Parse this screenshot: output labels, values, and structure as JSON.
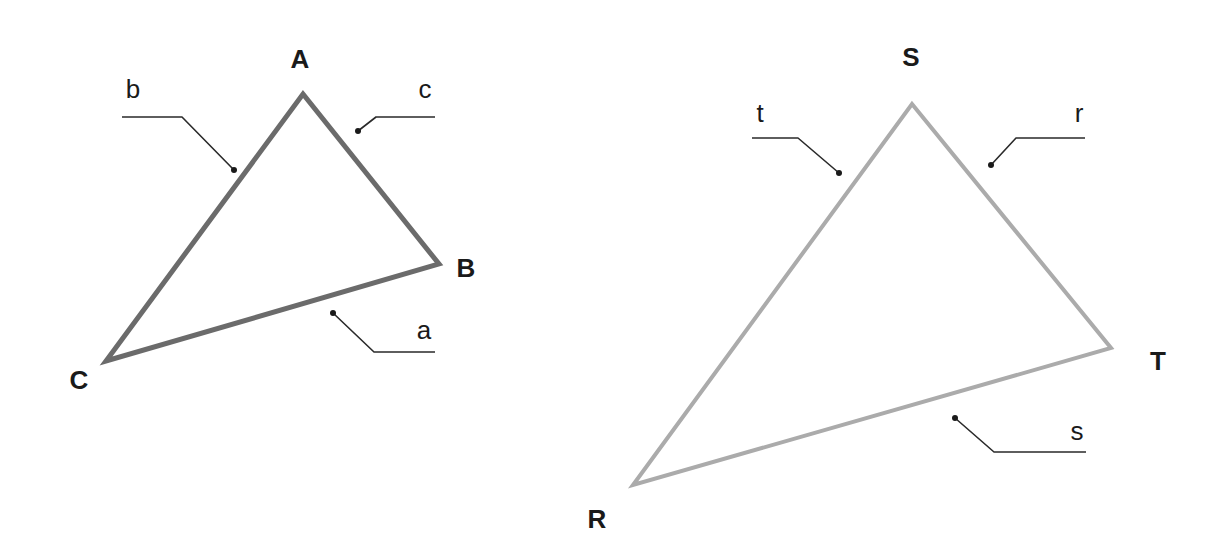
{
  "diagram": {
    "title": "",
    "triangles": [
      {
        "id": "ABC",
        "stroke_color": "#6b6b6b",
        "stroke_width": 5,
        "vertices": {
          "A": {
            "label": "A",
            "x": 303,
            "y": 94,
            "label_x": 300,
            "label_y": 68
          },
          "B": {
            "label": "B",
            "x": 439,
            "y": 264,
            "label_x": 466,
            "label_y": 277
          },
          "C": {
            "label": "C",
            "x": 106,
            "y": 361,
            "label_x": 79,
            "label_y": 389
          }
        },
        "sides": {
          "a": {
            "label": "a",
            "between": "B-C",
            "label_x": 424,
            "label_y": 339,
            "leader": [
              [
                333,
                313
              ],
              [
                374,
                352
              ],
              [
                435,
                352
              ]
            ]
          },
          "b": {
            "label": "b",
            "between": "A-C",
            "label_x": 133,
            "label_y": 98,
            "leader": [
              [
                234,
                170
              ],
              [
                182,
                117
              ],
              [
                122,
                117
              ]
            ]
          },
          "c": {
            "label": "c",
            "between": "A-B",
            "label_x": 425,
            "label_y": 98,
            "leader": [
              [
                358,
                131
              ],
              [
                376,
                117
              ],
              [
                435,
                117
              ]
            ]
          }
        }
      },
      {
        "id": "RST",
        "stroke_color": "#ababab",
        "stroke_width": 4,
        "vertices": {
          "S": {
            "label": "S",
            "x": 912,
            "y": 104,
            "label_x": 911,
            "label_y": 66
          },
          "T": {
            "label": "T",
            "x": 1111,
            "y": 348,
            "label_x": 1158,
            "label_y": 370
          },
          "R": {
            "label": "R",
            "x": 633,
            "y": 485,
            "label_x": 597,
            "label_y": 528
          }
        },
        "sides": {
          "r": {
            "label": "r",
            "between": "S-T",
            "label_x": 1079,
            "label_y": 122,
            "leader": [
              [
                991,
                165
              ],
              [
                1016,
                138
              ],
              [
                1085,
                138
              ]
            ]
          },
          "s": {
            "label": "s",
            "between": "R-T",
            "label_x": 1077,
            "label_y": 440,
            "leader": [
              [
                955,
                418
              ],
              [
                994,
                452
              ],
              [
                1086,
                452
              ]
            ]
          },
          "t": {
            "label": "t",
            "between": "R-S",
            "label_x": 760,
            "label_y": 122,
            "leader": [
              [
                839,
                173
              ],
              [
                798,
                138
              ],
              [
                752,
                138
              ]
            ]
          }
        }
      }
    ]
  }
}
